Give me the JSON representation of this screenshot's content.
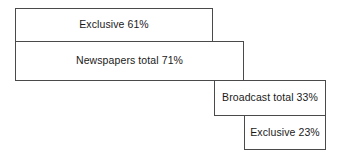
{
  "figure": {
    "width": 338,
    "height": 159,
    "background_color": "#ffffff",
    "border_color": "#4a4a4a",
    "text_color": "#1a1a1a"
  },
  "chart_data": {
    "type": "bar",
    "title": "",
    "subtitle": "",
    "xlabel": "",
    "ylabel": "",
    "orientation": "horizontal",
    "grid": false,
    "legend": false,
    "axis_visible": false,
    "value_unit": "%",
    "xlim": [
      0,
      100
    ],
    "categories": [
      "Exclusive",
      "Newspapers total",
      "Broadcast total",
      "Exclusive"
    ],
    "values": [
      61,
      71,
      33,
      23
    ],
    "bars": [
      {
        "label": "Exclusive 61%",
        "category": "Exclusive",
        "value": 61,
        "group": "Newspapers",
        "offset": 0
      },
      {
        "label": "Newspapers total 71%",
        "category": "Newspapers total",
        "value": 71,
        "group": "Newspapers",
        "offset": 0
      },
      {
        "label": "Broadcast total 33%",
        "category": "Broadcast total",
        "value": 33,
        "group": "Broadcast",
        "offset": 67
      },
      {
        "label": "Exclusive 23%",
        "category": "Exclusive",
        "value": 23,
        "group": "Broadcast",
        "offset": 77
      }
    ],
    "annotations": []
  }
}
